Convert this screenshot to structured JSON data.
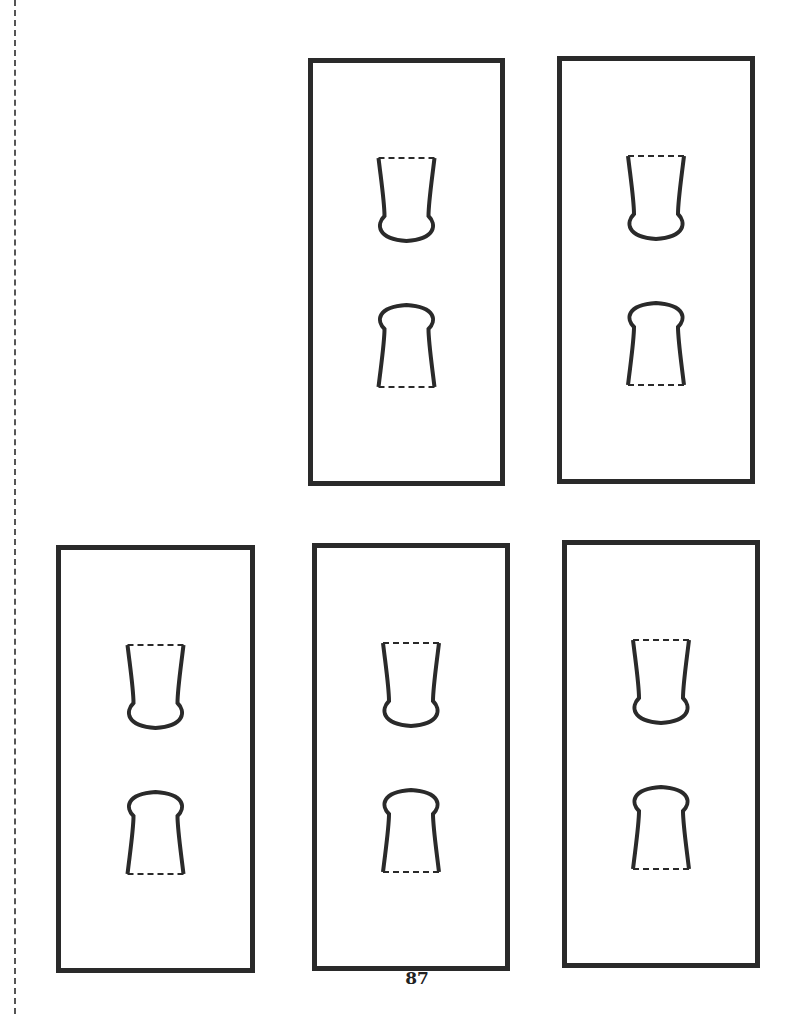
{
  "page": {
    "number": "87",
    "cut_line": "dashed vertical cut guide on left margin",
    "line_color": "#2a2a2a"
  },
  "panels": [
    {
      "id": "top-middle",
      "left": 308,
      "top": 58,
      "width": 197,
      "height": 428
    },
    {
      "id": "top-right",
      "left": 557,
      "top": 56,
      "width": 198,
      "height": 428
    },
    {
      "id": "bottom-left",
      "left": 56,
      "top": 545,
      "width": 199,
      "height": 428
    },
    {
      "id": "bottom-middle",
      "left": 312,
      "top": 543,
      "width": 198,
      "height": 428
    },
    {
      "id": "bottom-right",
      "left": 562,
      "top": 540,
      "width": 198,
      "height": 428
    }
  ],
  "cutout_shapes": {
    "upper": "cup-shape with dashed top fold line",
    "lower": "keyhole-shape with dashed bottom fold line"
  }
}
